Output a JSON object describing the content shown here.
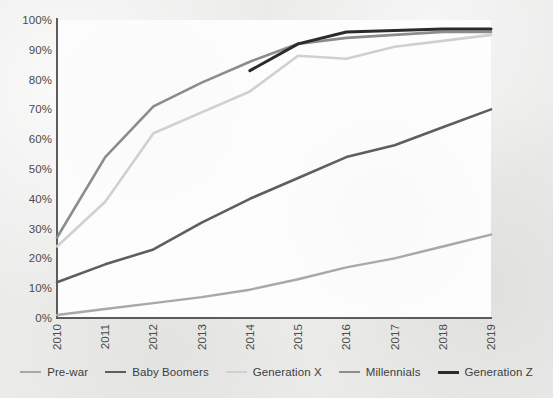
{
  "chart_data": {
    "type": "line",
    "title": "",
    "subtitle": "",
    "xlabel": "",
    "ylabel": "",
    "categories": [
      "2010",
      "2011",
      "2012",
      "2013",
      "2014",
      "2015",
      "2016",
      "2017",
      "2018",
      "2019"
    ],
    "x": [
      2010,
      2011,
      2012,
      2013,
      2014,
      2015,
      2016,
      2017,
      2018,
      2019
    ],
    "ylim": [
      0,
      100
    ],
    "ytick_labels": [
      "0%",
      "10%",
      "20%",
      "30%",
      "40%",
      "50%",
      "60%",
      "70%",
      "80%",
      "90%",
      "100%"
    ],
    "ytick_values": [
      0,
      10,
      20,
      30,
      40,
      50,
      60,
      70,
      80,
      90,
      100
    ],
    "grid": false,
    "legend_position": "bottom",
    "value_suffix": "%",
    "series": [
      {
        "name": "Pre-war",
        "color": "#a8a8a8",
        "width": 2.4,
        "values": [
          1,
          3,
          5,
          7,
          9.5,
          13,
          17,
          20,
          24,
          28
        ]
      },
      {
        "name": "Baby Boomers",
        "color": "#5e5e5e",
        "width": 2.6,
        "values": [
          12,
          18,
          23,
          32,
          40,
          47,
          54,
          58,
          64,
          70
        ]
      },
      {
        "name": "Generation X",
        "color": "#d0d0d0",
        "width": 2.6,
        "values": [
          24,
          39,
          62,
          69,
          76,
          88,
          87,
          91,
          93,
          95
        ]
      },
      {
        "name": "Millennials",
        "color": "#8c8c8c",
        "width": 2.6,
        "values": [
          27,
          54,
          71,
          79,
          86,
          92,
          94,
          95,
          96,
          96
        ]
      },
      {
        "name": "Generation Z",
        "color": "#2b2b2b",
        "width": 3.0,
        "values": [
          null,
          null,
          null,
          null,
          83,
          92,
          96,
          96.5,
          97,
          97
        ]
      }
    ]
  },
  "legend": {
    "items": [
      {
        "label": "Pre-war",
        "color": "#a8a8a8"
      },
      {
        "label": "Baby Boomers",
        "color": "#5e5e5e"
      },
      {
        "label": "Generation X",
        "color": "#d0d0d0"
      },
      {
        "label": "Millennials",
        "color": "#8c8c8c"
      },
      {
        "label": "Generation Z",
        "color": "#2b2b2b"
      }
    ]
  },
  "axes": {
    "y_ticks": [
      "0%",
      "10%",
      "20%",
      "30%",
      "40%",
      "50%",
      "60%",
      "70%",
      "80%",
      "90%",
      "100%"
    ],
    "x_ticks": [
      "2010",
      "2011",
      "2012",
      "2013",
      "2014",
      "2015",
      "2016",
      "2017",
      "2018",
      "2019"
    ]
  },
  "colors": {
    "background": "#ebebea",
    "plot_background": "#fdfdfd",
    "axis": "#5c5c5c",
    "tick_text": "#4a4a4a"
  }
}
